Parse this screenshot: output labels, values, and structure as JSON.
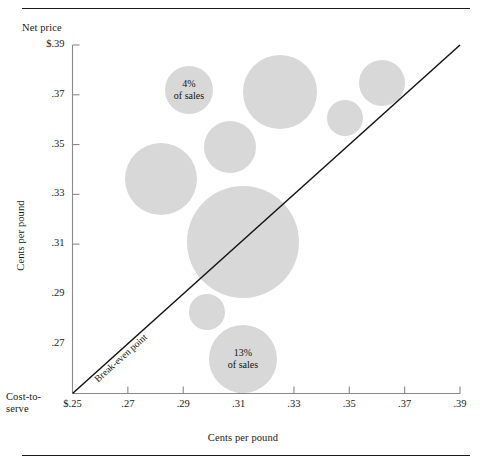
{
  "figure": {
    "y_axis_caption": "Net price",
    "x_axis_caption_line1": "Cost-to-",
    "x_axis_caption_line2": "serve",
    "x_axis_title": "Cents per pound",
    "y_axis_title": "Cents per pound",
    "breakeven_label": "Break-even point",
    "bubble_color": "#d8d8d8",
    "rule_color": "#1b1b1b"
  },
  "chart_data": {
    "type": "scatter",
    "title": "",
    "xlabel": "Cents per pound",
    "ylabel": "Cents per pound",
    "x_axis_name": "Cost-to-serve",
    "y_axis_name": "Net price",
    "xlim": [
      0.25,
      0.39
    ],
    "ylim": [
      0.25,
      0.39
    ],
    "grid": false,
    "legend": "none",
    "xticks": [
      "$.25",
      ".27",
      ".29",
      ".31",
      ".33",
      ".35",
      ".37",
      ".39"
    ],
    "yticks": [
      "$.39",
      ".37",
      ".35",
      ".33",
      ".31",
      ".29",
      ".27"
    ],
    "xtick_values": [
      0.25,
      0.27,
      0.29,
      0.31,
      0.33,
      0.35,
      0.37,
      0.39
    ],
    "ytick_values": [
      0.39,
      0.37,
      0.35,
      0.33,
      0.31,
      0.29,
      0.27
    ],
    "reference_line": {
      "label": "Break-even point",
      "from": [
        0.25,
        0.25
      ],
      "to": [
        0.39,
        0.39
      ],
      "description": "45-degree break-even line where net price equals cost-to-serve"
    },
    "points": [
      {
        "id": "b1",
        "cost_to_serve": 0.2907,
        "net_price": 0.3743,
        "share_of_sales_pct": 4,
        "label": "4%\nof sales",
        "cx": 189,
        "cy": 90,
        "r": 24
      },
      {
        "id": "b2",
        "cost_to_serve": 0.312,
        "net_price": 0.3737,
        "share_of_sales_pct": null,
        "label": "",
        "cx": 280,
        "cy": 92,
        "r": 37
      },
      {
        "id": "b3",
        "cost_to_serve": 0.3377,
        "net_price": 0.3607,
        "share_of_sales_pct": null,
        "label": "",
        "cx": 382,
        "cy": 83,
        "r": 23
      },
      {
        "id": "b4",
        "cost_to_serve": 0.3283,
        "net_price": 0.3475,
        "share_of_sales_pct": null,
        "label": "",
        "cx": 345,
        "cy": 118,
        "r": 18
      },
      {
        "id": "b5",
        "cost_to_serve": 0.299,
        "net_price": 0.3367,
        "share_of_sales_pct": null,
        "label": "",
        "cx": 230,
        "cy": 147,
        "r": 26
      },
      {
        "id": "b6",
        "cost_to_serve": 0.2816,
        "net_price": 0.3247,
        "share_of_sales_pct": null,
        "label": "",
        "cx": 161,
        "cy": 179,
        "r": 36
      },
      {
        "id": "b7",
        "cost_to_serve": 0.3023,
        "net_price": 0.3017,
        "share_of_sales_pct": null,
        "label": "",
        "cx": 243,
        "cy": 242,
        "r": 56
      },
      {
        "id": "b8",
        "cost_to_serve": 0.2932,
        "net_price": 0.2841,
        "share_of_sales_pct": null,
        "label": "",
        "cx": 207,
        "cy": 312,
        "r": 18
      },
      {
        "id": "b9",
        "cost_to_serve": 0.3023,
        "net_price": 0.2722,
        "share_of_sales_pct": 13,
        "label": "13%\nof sales",
        "cx": 243,
        "cy": 359,
        "r": 34
      }
    ],
    "annotations": [
      {
        "text": "4%",
        "subtext": "of sales",
        "target": "b1"
      },
      {
        "text": "13%",
        "subtext": "of sales",
        "target": "b9"
      },
      {
        "text": "Break-even point",
        "target": "reference_line"
      }
    ]
  },
  "labels": {
    "b1_line1": "4%",
    "b1_line2": "of sales",
    "b9_line1": "13%",
    "b9_line2": "of sales"
  }
}
